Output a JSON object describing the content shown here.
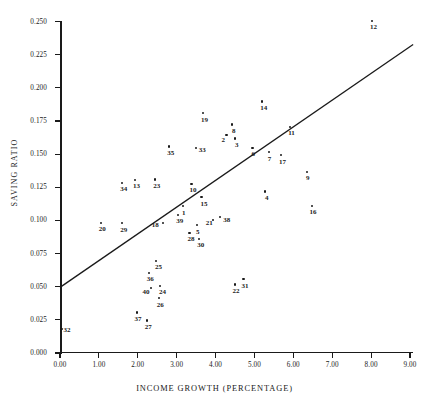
{
  "chart_data": {
    "type": "scatter",
    "title": "",
    "xlabel": "INCOME GROWTH (PERCENTAGE)",
    "ylabel": "SAVING RATIO",
    "xlim": [
      0.0,
      9.0
    ],
    "ylim": [
      0.0,
      0.25
    ],
    "grid": false,
    "legend": "none",
    "xticks": [
      "0.00",
      "1.00",
      "2.00",
      "3.00",
      "4.00",
      "5.00",
      "6.00",
      "7.00",
      "8.00",
      "9.00"
    ],
    "xtick_values": [
      0,
      1,
      2,
      3,
      4,
      5,
      6,
      7,
      8,
      9
    ],
    "yticks": [
      "0.000",
      "0.025",
      "0.050",
      "0.075",
      "0.100",
      "0.125",
      "0.150",
      "0.175",
      "0.200",
      "0.225",
      "0.250"
    ],
    "ytick_values": [
      0.0,
      0.025,
      0.05,
      0.075,
      0.1,
      0.125,
      0.15,
      0.175,
      0.2,
      0.225,
      0.25
    ],
    "point_color": "#1a1a1a",
    "line_color": "#1a1a1a",
    "fit_line": {
      "x0": 0.0,
      "y0": 0.0495,
      "x1": 9.08,
      "y1": 0.2327
    },
    "points": [
      {
        "label": "1",
        "x": 3.16,
        "y": 0.1108
      },
      {
        "label": "2",
        "x": 4.28,
        "y": 0.1643
      },
      {
        "label": "3",
        "x": 4.5,
        "y": 0.1617
      },
      {
        "label": "4",
        "x": 5.27,
        "y": 0.1218
      },
      {
        "label": "5",
        "x": 3.52,
        "y": 0.0963
      },
      {
        "label": "6",
        "x": 4.95,
        "y": 0.1549
      },
      {
        "label": "7",
        "x": 5.37,
        "y": 0.1513
      },
      {
        "label": "8",
        "x": 4.42,
        "y": 0.1723
      },
      {
        "label": "9",
        "x": 6.35,
        "y": 0.1368
      },
      {
        "label": "10",
        "x": 3.38,
        "y": 0.1275
      },
      {
        "label": "11",
        "x": 5.92,
        "y": 0.1706
      },
      {
        "label": "12",
        "x": 8.02,
        "y": 0.2506
      },
      {
        "label": "13",
        "x": 1.93,
        "y": 0.1307
      },
      {
        "label": "14",
        "x": 5.2,
        "y": 0.1897
      },
      {
        "label": "15",
        "x": 3.64,
        "y": 0.1175
      },
      {
        "label": "16",
        "x": 6.47,
        "y": 0.1109
      },
      {
        "label": "17",
        "x": 5.68,
        "y": 0.1491
      },
      {
        "label": "18",
        "x": 2.64,
        "y": 0.0983
      },
      {
        "label": "19",
        "x": 3.68,
        "y": 0.1808
      },
      {
        "label": "20",
        "x": 1.05,
        "y": 0.0983
      },
      {
        "label": "21",
        "x": 3.93,
        "y": 0.1005
      },
      {
        "label": "22",
        "x": 4.49,
        "y": 0.0516
      },
      {
        "label": "23",
        "x": 2.45,
        "y": 0.1309
      },
      {
        "label": "24",
        "x": 2.57,
        "y": 0.0507
      },
      {
        "label": "25",
        "x": 2.47,
        "y": 0.0694
      },
      {
        "label": "26",
        "x": 2.54,
        "y": 0.0412
      },
      {
        "label": "27",
        "x": 2.23,
        "y": 0.0245
      },
      {
        "label": "28",
        "x": 3.33,
        "y": 0.0905
      },
      {
        "label": "29",
        "x": 1.6,
        "y": 0.0979
      },
      {
        "label": "30",
        "x": 3.58,
        "y": 0.0862
      },
      {
        "label": "31",
        "x": 4.72,
        "y": 0.0558
      },
      {
        "label": "32",
        "x": 0.04,
        "y": 0.0184
      },
      {
        "label": "33",
        "x": 3.49,
        "y": 0.1549
      },
      {
        "label": "34",
        "x": 1.6,
        "y": 0.1285
      },
      {
        "label": "35",
        "x": 2.81,
        "y": 0.1557
      },
      {
        "label": "36",
        "x": 2.28,
        "y": 0.0605
      },
      {
        "label": "37",
        "x": 1.97,
        "y": 0.0306
      },
      {
        "label": "38",
        "x": 4.12,
        "y": 0.1027
      },
      {
        "label": "39",
        "x": 3.04,
        "y": 0.1038
      },
      {
        "label": "40",
        "x": 2.35,
        "y": 0.0489
      }
    ],
    "label_offsets": {
      "1": [
        -1,
        7
      ],
      "2": [
        -5,
        5
      ],
      "3": [
        0,
        7
      ],
      "4": [
        0,
        7
      ],
      "5": [
        -1,
        7
      ],
      "6": [
        -1,
        7
      ],
      "7": [
        -1,
        7
      ],
      "8": [
        0,
        7
      ],
      "9": [
        -1,
        7
      ],
      "10": [
        -2,
        7
      ],
      "11": [
        -2,
        7
      ],
      "12": [
        -2,
        7
      ],
      "13": [
        -2,
        7
      ],
      "14": [
        -2,
        7
      ],
      "15": [
        -1,
        7
      ],
      "16": [
        -2,
        7
      ],
      "17": [
        -2,
        7
      ],
      "18": [
        -11,
        3
      ],
      "19": [
        -2,
        7
      ],
      "20": [
        -2,
        7
      ],
      "21": [
        -7,
        4
      ],
      "22": [
        -2,
        7
      ],
      "23": [
        -2,
        7
      ],
      "24": [
        -1,
        7
      ],
      "25": [
        -1,
        7
      ],
      "26": [
        -2,
        7
      ],
      "27": [
        -2,
        7
      ],
      "28": [
        -2,
        7
      ],
      "29": [
        -2,
        7
      ],
      "30": [
        -2,
        7
      ],
      "31": [
        -2,
        7
      ],
      "32": [
        2,
        2
      ],
      "33": [
        3,
        3
      ],
      "34": [
        -2,
        7
      ],
      "35": [
        -2,
        7
      ],
      "36": [
        -2,
        7
      ],
      "37": [
        -2,
        7
      ],
      "38": [
        3,
        4
      ],
      "39": [
        -2,
        6
      ],
      "40": [
        -9,
        4
      ]
    }
  }
}
